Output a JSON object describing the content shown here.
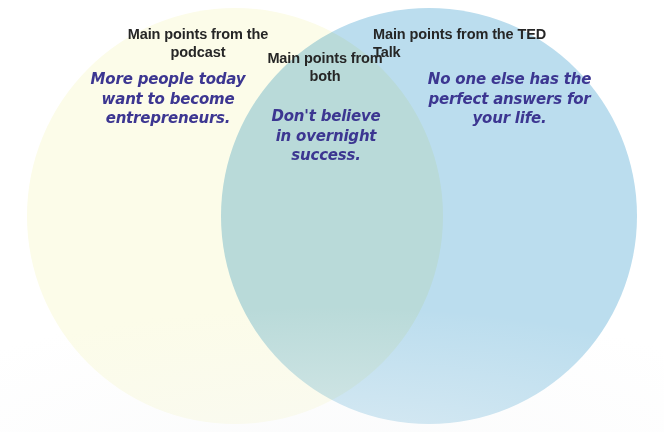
{
  "diagram": {
    "type": "venn",
    "background_color": "#ffffff",
    "sets": [
      {
        "id": "left",
        "name": "podcast",
        "heading": "Main points from the podcast",
        "note": "More people today want to become entrepreneurs.",
        "fill_color": "#fcfce9",
        "heading_color": "#262626",
        "note_color": "#3c3691"
      },
      {
        "id": "intersection",
        "name": "both",
        "heading": "Main points from both",
        "note": "Don't believe in overnight success.",
        "fill_color": "#cde7e9",
        "heading_color": "#262626",
        "note_color": "#3c3691"
      },
      {
        "id": "right",
        "name": "ted-talk",
        "heading": "Main points from the TED Talk",
        "note": "No one else has the perfect answers for your life.",
        "fill_color": "#bbddee",
        "heading_color": "#262626",
        "note_color": "#3c3691"
      }
    ]
  }
}
